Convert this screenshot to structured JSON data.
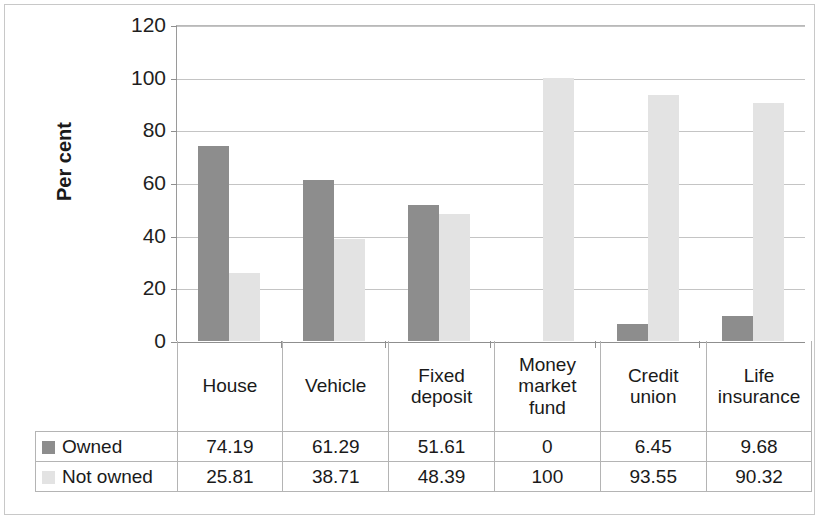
{
  "chart_data": {
    "type": "bar",
    "title": "",
    "subtitle": "",
    "xlabel": "",
    "ylabel": "Per cent",
    "ylim": [
      0,
      120
    ],
    "yticks": [
      120,
      100,
      80,
      60,
      40,
      20,
      0
    ],
    "grid": true,
    "grid_axis": "y",
    "legend_position": "table-row-headers",
    "categories": [
      "House",
      "Vehicle",
      "Fixed deposit",
      "Money market fund",
      "Credit union",
      "Life insurance"
    ],
    "category_lines": [
      [
        "House"
      ],
      [
        "Vehicle"
      ],
      [
        "Fixed",
        "deposit"
      ],
      [
        "Money",
        "market",
        "fund"
      ],
      [
        "Credit",
        "union"
      ],
      [
        "Life",
        "insurance"
      ]
    ],
    "series": [
      {
        "name": "Owned",
        "color": "#8d8d8d",
        "values": [
          74.19,
          61.29,
          51.61,
          0,
          6.45,
          9.68
        ],
        "labels": [
          "74.19",
          "61.29",
          "51.61",
          "0",
          "6.45",
          "9.68"
        ]
      },
      {
        "name": "Not owned",
        "color": "#e3e3e3",
        "values": [
          25.81,
          38.71,
          48.39,
          100,
          93.55,
          90.32
        ],
        "labels": [
          "25.81",
          "38.71",
          "48.39",
          "100",
          "93.55",
          "90.32"
        ]
      }
    ]
  },
  "table": {
    "row_header_icons": [
      "owned-swatch",
      "not-owned-swatch"
    ]
  },
  "colors": {
    "owned": "#8d8d8d",
    "not_owned": "#e3e3e3",
    "gridline": "#c4c4c4",
    "axis": "#8f8f8f",
    "text": "#1a1a1a",
    "frame": "#c8c8c8",
    "background": "#ffffff"
  }
}
